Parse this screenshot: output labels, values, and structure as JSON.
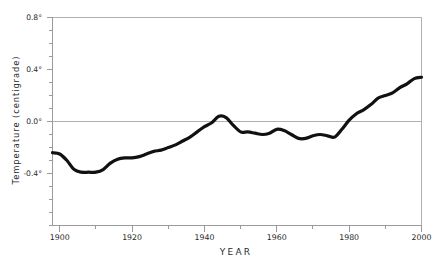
{
  "chart_data": {
    "type": "line",
    "title": "",
    "xlabel": "YEAR",
    "ylabel": "Temperature (centigrade)",
    "xlim": [
      1898,
      2000
    ],
    "ylim": [
      -0.8,
      0.8
    ],
    "grid": false,
    "legend": null,
    "zero_line": 0.0,
    "x_ticks": [
      1900,
      1920,
      1940,
      1960,
      1980,
      2000
    ],
    "x_tick_labels": [
      "1900",
      "1920",
      "1940",
      "1960",
      "1980",
      "2000"
    ],
    "x_minor_tick_step": 10,
    "y_ticks": [
      -0.4,
      0.0,
      0.4,
      0.8
    ],
    "y_tick_labels": [
      "-0.4°",
      "0.0°",
      "0.4°",
      "0.8°"
    ],
    "y_minor_tick_step": 0.1,
    "series": [
      {
        "name": "Global mean temperature anomaly",
        "color": "#111111",
        "line_width": 3.2,
        "x": [
          1898,
          1900,
          1902,
          1904,
          1906,
          1908,
          1910,
          1912,
          1914,
          1916,
          1918,
          1920,
          1922,
          1924,
          1926,
          1928,
          1930,
          1932,
          1934,
          1936,
          1938,
          1940,
          1942,
          1944,
          1946,
          1948,
          1950,
          1952,
          1954,
          1956,
          1958,
          1960,
          1962,
          1964,
          1966,
          1968,
          1970,
          1972,
          1974,
          1976,
          1978,
          1980,
          1982,
          1984,
          1986,
          1988,
          1990,
          1992,
          1994,
          1996,
          1998,
          2000
        ],
        "y": [
          -0.24,
          -0.25,
          -0.3,
          -0.37,
          -0.39,
          -0.39,
          -0.39,
          -0.37,
          -0.32,
          -0.29,
          -0.28,
          -0.28,
          -0.27,
          -0.25,
          -0.23,
          -0.22,
          -0.2,
          -0.18,
          -0.15,
          -0.12,
          -0.08,
          -0.04,
          -0.01,
          0.04,
          0.03,
          -0.03,
          -0.08,
          -0.08,
          -0.09,
          -0.1,
          -0.09,
          -0.06,
          -0.07,
          -0.1,
          -0.13,
          -0.13,
          -0.11,
          -0.1,
          -0.11,
          -0.12,
          -0.06,
          0.01,
          0.06,
          0.09,
          0.13,
          0.18,
          0.2,
          0.22,
          0.26,
          0.29,
          0.33,
          0.34
        ]
      }
    ]
  },
  "axes": {
    "y_title": "Temperature (centigrade)",
    "x_title": "YEAR",
    "y_labels": [
      {
        "text": "0.8°",
        "value": 0.8
      },
      {
        "text": "0.4°",
        "value": 0.4
      },
      {
        "text": "0.0°",
        "value": 0.0
      },
      {
        "text": "-0.4°",
        "value": -0.4
      }
    ],
    "x_labels": [
      {
        "text": "1900",
        "value": 1900
      },
      {
        "text": "1920",
        "value": 1920
      },
      {
        "text": "1940",
        "value": 1940
      },
      {
        "text": "1960",
        "value": 1960
      },
      {
        "text": "1980",
        "value": 1980
      },
      {
        "text": "2000",
        "value": 2000
      }
    ]
  },
  "style": {
    "background": "#ffffff",
    "axis_color": "#9a9a9a",
    "frame_color": "#b0b0b0",
    "text_color": "#2a2a2a",
    "series_color": "#111111"
  }
}
